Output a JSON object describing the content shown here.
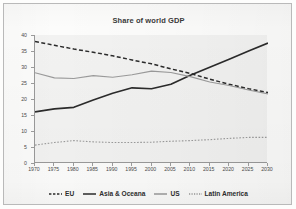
{
  "chart_data": {
    "type": "line",
    "title": "Share of world GDP",
    "xlabel": "",
    "ylabel": "Percentage (%)",
    "x": [
      1970,
      1975,
      1980,
      1985,
      1990,
      1995,
      2000,
      2005,
      2010,
      2015,
      2020,
      2025,
      2030
    ],
    "xtick_labels": [
      "1970",
      "1975",
      "1980",
      "1985",
      "1990",
      "1995",
      "2000",
      "2005",
      "2010",
      "2015",
      "2020",
      "2025",
      "2030"
    ],
    "ytick_labels": [
      "0",
      "5",
      "10",
      "15",
      "20",
      "25",
      "30",
      "35",
      "40"
    ],
    "xlim": [
      1970,
      2030
    ],
    "ylim": [
      0,
      40
    ],
    "ystep": 5,
    "grid": false,
    "legend_position": "bottom",
    "series": [
      {
        "name": "EU",
        "style": "dashed",
        "color": "#2b2b2b",
        "values": [
          38.0,
          36.8,
          35.6,
          34.6,
          33.5,
          32.2,
          31.0,
          29.4,
          28.0,
          26.2,
          24.6,
          23.2,
          22.0
        ]
      },
      {
        "name": "Asia & Oceana",
        "style": "solid",
        "color": "#2b2b2b",
        "values": [
          16.0,
          16.9,
          17.4,
          19.7,
          21.8,
          23.5,
          23.2,
          24.6,
          27.4,
          29.9,
          32.4,
          35.0,
          37.5
        ]
      },
      {
        "name": "US",
        "style": "solid",
        "color": "#9b9b9b",
        "values": [
          28.2,
          26.6,
          26.4,
          27.3,
          26.8,
          27.6,
          28.7,
          28.3,
          27.0,
          25.3,
          24.2,
          22.8,
          21.6
        ]
      },
      {
        "name": "Latin America",
        "style": "dotted",
        "color": "#9b9b9b",
        "values": [
          5.6,
          6.4,
          7.0,
          6.6,
          6.4,
          6.4,
          6.5,
          6.8,
          7.0,
          7.3,
          7.7,
          8.0,
          8.0
        ]
      }
    ]
  },
  "legend": {
    "items": [
      {
        "label": "EU",
        "style": "dashed",
        "color": "#2b2b2b"
      },
      {
        "label": "Asia & Oceana",
        "style": "solid",
        "color": "#2b2b2b"
      },
      {
        "label": "US",
        "style": "solid",
        "color": "#9b9b9b"
      },
      {
        "label": "Latin America",
        "style": "dotted",
        "color": "#9b9b9b"
      }
    ]
  }
}
